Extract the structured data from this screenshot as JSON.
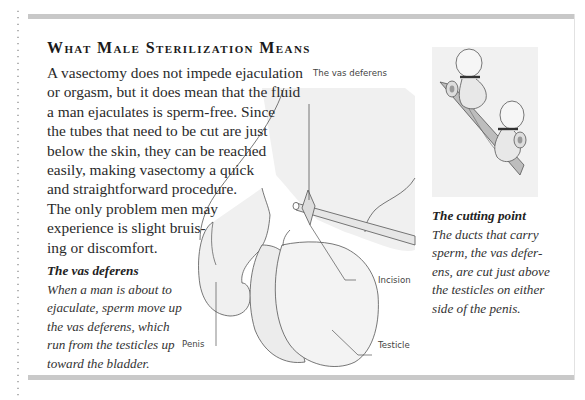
{
  "article": {
    "title": "What Male Sterilization Means",
    "body_lines": [
      "A vasectomy does not impede ejaculation",
      "or orgasm, but it does mean that the fluid",
      "a man ejaculates is sperm-free. Since",
      "the tubes that need to be cut are just",
      "below the skin, they can be reached",
      "easily, making vasectomy a quick",
      "and straightforward procedure.",
      "The only problem men may",
      "experience is slight bruis-",
      "ing or discomfort."
    ]
  },
  "captions": {
    "vas_deferens": {
      "heading": "The vas deferens",
      "lines": [
        "When a man is about to",
        "ejaculate, sperm move up",
        "the vas deferens, which",
        "run from the testicles up",
        "toward the bladder."
      ]
    },
    "cutting_point": {
      "heading": "The cutting point",
      "lines": [
        "The ducts that carry",
        "sperm, the vas defer-",
        "ens, are cut just above",
        "the testicles on either",
        "side of the penis."
      ]
    }
  },
  "diagram_labels": {
    "vas_deferens": "The vas deferens",
    "incision": "Incision",
    "penis": "Penis",
    "testicle": "Testicle"
  },
  "colors": {
    "rule_gray": "#c8c8c8",
    "fill_light": "#efefef",
    "text": "#2a2a2a"
  }
}
